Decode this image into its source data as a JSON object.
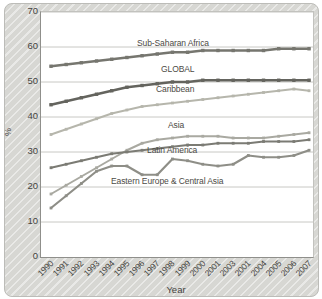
{
  "chart_data": {
    "type": "line",
    "title": "",
    "xlabel": "Year",
    "ylabel": "%",
    "ylim": [
      0,
      70
    ],
    "y_ticks": [
      70,
      60,
      50,
      40,
      30,
      20,
      10,
      0
    ],
    "grid": true,
    "legend_position": "inline-labels-on-plot",
    "x_years": [
      1990,
      1991,
      1992,
      1993,
      1994,
      1995,
      1996,
      1997,
      1998,
      1999,
      2000,
      2001,
      2002,
      2003,
      2004,
      2005,
      2006,
      2007
    ],
    "x_tick_labels_as_printed": [
      "1990",
      "1991",
      "1992",
      "1993",
      "1994",
      "1995",
      "1996",
      "1997",
      "1998",
      "1999",
      "2000",
      "2001",
      "2003",
      "2001",
      "2004",
      "2005",
      "2006",
      "2007"
    ],
    "series": [
      {
        "name": "Sub-Saharan Africa",
        "color": "#76766f",
        "line_width": 2.6,
        "marker": "square",
        "values": [
          54.5,
          55,
          55.5,
          56,
          56.5,
          57,
          57.5,
          58,
          58.5,
          58.5,
          59,
          59,
          59,
          59,
          59,
          59.5,
          59.5,
          59.5
        ]
      },
      {
        "name": "GLOBAL",
        "color": "#64645e",
        "line_width": 2.6,
        "marker": "square",
        "values": [
          43.5,
          44.5,
          45.5,
          46.5,
          47.5,
          48.5,
          49,
          49.5,
          50,
          50,
          50.5,
          50.5,
          50.5,
          50.5,
          50.5,
          50.5,
          50.5,
          50.5
        ]
      },
      {
        "name": "Caribbean",
        "color": "#b6b6ac",
        "line_width": 2,
        "marker": "square",
        "values": [
          35,
          36.5,
          38,
          39.5,
          41,
          42,
          43,
          43.5,
          44,
          44.5,
          45,
          45.5,
          46,
          46.5,
          47,
          47.5,
          48,
          47.5
        ]
      },
      {
        "name": "Asia",
        "color": "#a9a9a1",
        "line_width": 2,
        "marker": "square",
        "values": [
          18,
          20.5,
          23,
          25.5,
          28,
          30.5,
          32.5,
          33.5,
          34,
          34.5,
          34.5,
          34.5,
          34,
          34,
          34,
          34.5,
          35,
          35.5
        ]
      },
      {
        "name": "Latin America",
        "color": "#7b7b74",
        "line_width": 2.2,
        "marker": "square",
        "values": [
          25.5,
          26.5,
          27.5,
          28.5,
          29.5,
          30,
          30.5,
          31,
          31.5,
          32,
          32,
          32.5,
          32.5,
          32.5,
          33,
          33,
          33,
          33.5
        ]
      },
      {
        "name": "Eastern Europe & Central Asia",
        "color": "#8e8e87",
        "line_width": 2.2,
        "marker": "square",
        "values": [
          14,
          17.5,
          21,
          24.5,
          26,
          26,
          23.5,
          23.5,
          28,
          27.5,
          26.5,
          26,
          26.5,
          29,
          28.5,
          28.5,
          29,
          30.5
        ]
      }
    ]
  },
  "style": {
    "gridline_color": "#c8c8c4",
    "plot_background": "#ffffff",
    "panel_background": "#d7d7d3",
    "text_color": "#45443f"
  }
}
